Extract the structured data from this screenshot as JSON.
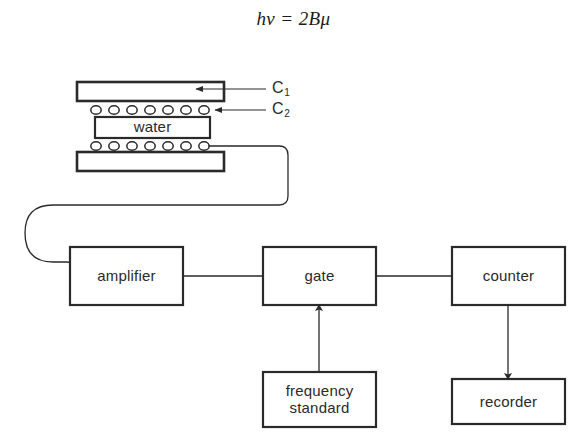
{
  "figure": {
    "equation": "hv = 2Bμ",
    "background_color": "#ffffff",
    "stroke_color": "#2a2a2a"
  },
  "apparatus": {
    "plate_top": {
      "name": "C1",
      "label": "C",
      "subscript": "1"
    },
    "coil_top": {
      "name": "C2",
      "label": "C",
      "subscript": "2",
      "turns": 7
    },
    "sample": {
      "label": "water"
    },
    "coil_bottom": {
      "turns": 7
    },
    "plate_bottom": {
      "label": ""
    },
    "callouts": [
      {
        "target": "plate-top",
        "label": "C",
        "subscript": "1"
      },
      {
        "target": "coil-top",
        "label": "C",
        "subscript": "2"
      }
    ]
  },
  "blocks": [
    {
      "id": "amplifier",
      "label": "amplifier"
    },
    {
      "id": "gate",
      "label": "gate"
    },
    {
      "id": "counter",
      "label": "counter"
    },
    {
      "id": "frequency-standard",
      "label": "frequency\nstandard"
    },
    {
      "id": "recorder",
      "label": "recorder"
    }
  ],
  "connections": [
    {
      "from": "coil-bottom",
      "to": "amplifier",
      "arrow": false
    },
    {
      "from": "amplifier",
      "to": "gate",
      "arrow": false
    },
    {
      "from": "gate",
      "to": "counter",
      "arrow": false
    },
    {
      "from": "frequency-standard",
      "to": "gate",
      "arrow": true
    },
    {
      "from": "counter",
      "to": "recorder",
      "arrow": true
    }
  ]
}
